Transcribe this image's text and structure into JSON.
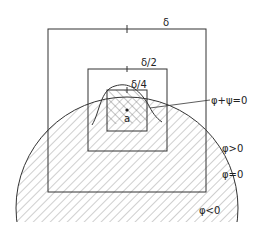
{
  "labels": {
    "delta": "δ",
    "delta_half": "δ/2",
    "delta_quarter": "δ/4",
    "point": "a",
    "interface": "φ+ψ=0",
    "phi_positive": "φ>0",
    "phi_zero": "φ=0",
    "phi_negative": "φ<0"
  },
  "colors": {
    "stroke": "#333333",
    "hatch": "#777777",
    "background": "#ffffff"
  }
}
